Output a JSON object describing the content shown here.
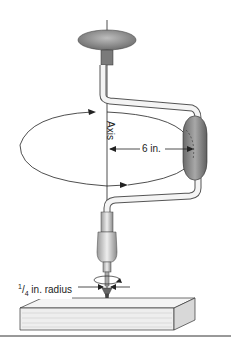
{
  "figure": {
    "labels": {
      "axis": "Axis",
      "crank_radius": "6 in.",
      "bit_radius_num": "1",
      "bit_radius_den": "4",
      "bit_radius_text": " in. radius"
    },
    "colors": {
      "knob": "#8a8a8a",
      "handle": "#7a7a7a",
      "line": "#222222",
      "wood": "#f2f2f2"
    }
  }
}
